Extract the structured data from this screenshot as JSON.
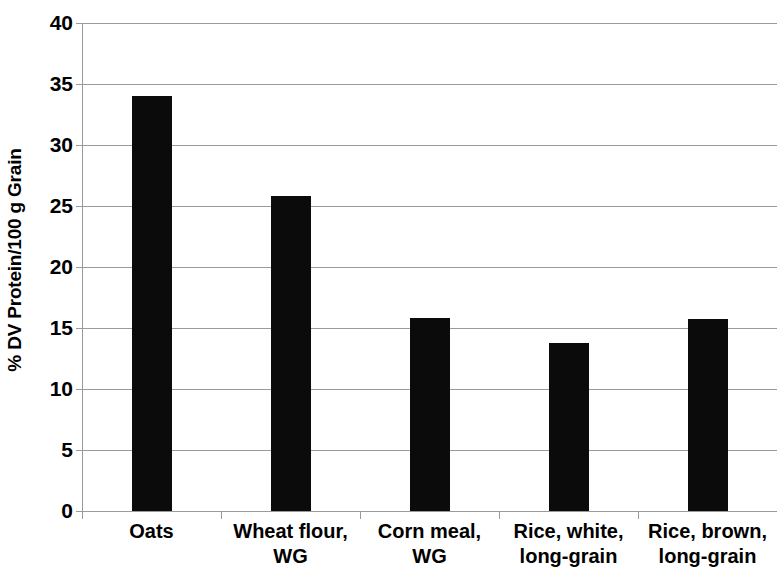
{
  "chart_data": {
    "type": "bar",
    "title": "",
    "subtitle": "",
    "xlabel": "",
    "ylabel": "% DV Protein/100 g Grain",
    "categories": [
      "Oats",
      "Wheat flour, WG",
      "Corn meal, WG",
      "Rice, white, long-grain",
      "Rice, brown, long-grain"
    ],
    "category_lines": [
      [
        "Oats"
      ],
      [
        "Wheat flour,",
        "WG"
      ],
      [
        "Corn meal,",
        "WG"
      ],
      [
        "Rice, white,",
        "long-grain"
      ],
      [
        "Rice, brown,",
        "long-grain"
      ]
    ],
    "values": [
      34.0,
      25.8,
      15.8,
      13.8,
      15.7
    ],
    "ylim": [
      0,
      40
    ],
    "ytick_step": 5,
    "yticks": [
      0,
      5,
      10,
      15,
      20,
      25,
      30,
      35,
      40
    ],
    "ytick_labels": [
      "0",
      "5",
      "10",
      "15",
      "20",
      "25",
      "30",
      "35",
      "40"
    ],
    "grid": true,
    "grid_axis": "y",
    "legend": false,
    "legend_position": "none",
    "bar_color": "#0b0b0b",
    "grid_color": "#9a9a9a",
    "background_color": "#ffffff",
    "text_color": "#000000"
  }
}
